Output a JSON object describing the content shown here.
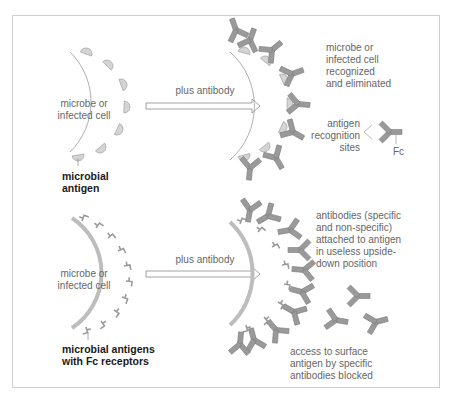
{
  "figure": {
    "top_panel": {
      "cell_label": "microbe or\ninfected cell",
      "arrow_label": "plus antibody",
      "antigen_label": "microbial\nantigen",
      "result_label": "microbe or\ninfected cell\nrecognized\nand eliminated",
      "antibody_legend": {
        "recognition_label": "antigen\nrecognition\nsites",
        "fc_label": "Fc"
      }
    },
    "bottom_panel": {
      "cell_label": "microbe or\ninfected cell",
      "arrow_label": "plus antibody",
      "antigen_label": "microbial antigens\nwith Fc receptors",
      "result_label": "antibodies (specific\nand non-specific)\nattached to antigen\nin useless upside-\ndown position",
      "blocked_label": "access to surface\nantigen by specific\nantibodies blocked"
    },
    "colors": {
      "antibody_fill": "#9a9a9a",
      "antigen_fill": "#d4d4d4",
      "outline": "#8a8a8a",
      "frame": "#cfcfcf",
      "label_text": "#666666",
      "bold_text": "#1a1a1a"
    }
  }
}
